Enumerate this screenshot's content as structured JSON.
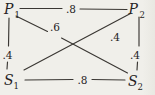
{
  "diagram": {
    "background": "#f0efea",
    "edge_shade": "#e9e8e2",
    "line_color": "#3a3733",
    "text_color": "#26231f",
    "nodes": [
      {
        "id": "P1",
        "letter": "P",
        "sub": "1",
        "x": 4,
        "y": 14,
        "sub_x": 14.5,
        "sub_y": 17.5
      },
      {
        "id": "P2",
        "letter": "P",
        "sub": "2",
        "x": 128.5,
        "y": 14,
        "sub_x": 139.5,
        "sub_y": 17.5
      },
      {
        "id": "S1",
        "letter": "S",
        "sub": "1",
        "x": 4,
        "y": 85,
        "sub_x": 13.5,
        "sub_y": 88.5
      },
      {
        "id": "S2",
        "letter": "S",
        "sub": "2",
        "x": 128,
        "y": 86,
        "sub_x": 137.5,
        "sub_y": 89.5
      }
    ],
    "edges": [
      {
        "id": "P1-P2",
        "weight": ".8",
        "segments": [
          [
            20,
            8.5,
            62,
            8.5
          ],
          [
            80,
            9,
            127,
            9.5
          ]
        ],
        "label_x": 71,
        "label_y": 8.5
      },
      {
        "id": "S1-S2",
        "weight": ".8",
        "segments": [
          [
            25,
            80,
            73,
            79.5
          ],
          [
            92,
            79.5,
            125,
            80
          ]
        ],
        "label_x": 82.5,
        "label_y": 79.5
      },
      {
        "id": "P1-S1",
        "weight": ".4",
        "segments": [
          [
            9,
            18,
            8.5,
            46
          ],
          [
            7.5,
            62,
            7,
            69
          ]
        ],
        "label_x": 7.5,
        "label_y": 55
      },
      {
        "id": "P2-S2",
        "weight": ".4",
        "segments": [
          [
            139,
            17,
            139,
            46
          ],
          [
            137.5,
            62,
            137,
            70
          ]
        ],
        "label_x": 135,
        "label_y": 55
      },
      {
        "id": "P1-S2",
        "weight": ".6",
        "segments": [
          [
            16,
            16,
            47.5,
            31.5
          ],
          [
            61.5,
            38,
            127.5,
            73
          ]
        ],
        "label_x": 55,
        "label_y": 27
      },
      {
        "id": "S1-P2",
        "weight": ".4",
        "segments": [
          [
            24,
            70,
            130.5,
            13.5
          ]
        ],
        "label_x": 115,
        "label_y": 37
      }
    ]
  }
}
